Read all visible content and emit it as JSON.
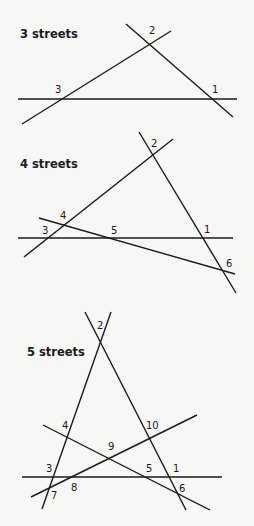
{
  "panels": [
    {
      "title": "3 streets",
      "title_pos": [
        20,
        38
      ],
      "lines": [
        [
          18,
          99,
          237,
          99
        ],
        [
          22,
          124,
          171,
          31
        ],
        [
          126,
          24,
          233,
          117
        ]
      ],
      "labels": [
        {
          "text": "2",
          "x": 149,
          "y": 34
        },
        {
          "text": "3",
          "x": 55,
          "y": 93
        },
        {
          "text": "1",
          "x": 212,
          "y": 93
        }
      ]
    },
    {
      "title": "4 streets",
      "title_pos": [
        20,
        168
      ],
      "lines": [
        [
          18,
          238,
          233,
          238
        ],
        [
          24,
          257,
          173,
          139
        ],
        [
          139,
          132,
          236,
          293
        ],
        [
          39,
          218,
          235,
          274
        ]
      ],
      "labels": [
        {
          "text": "2",
          "x": 151,
          "y": 147
        },
        {
          "text": "4",
          "x": 60,
          "y": 219
        },
        {
          "text": "3",
          "x": 42,
          "y": 234
        },
        {
          "text": "5",
          "x": 111,
          "y": 234
        },
        {
          "text": "1",
          "x": 204,
          "y": 233
        },
        {
          "text": "6",
          "x": 226,
          "y": 267
        }
      ]
    },
    {
      "title": "5 streets",
      "title_pos": [
        27,
        356
      ],
      "lines": [
        [
          22,
          477,
          222,
          477
        ],
        [
          42,
          509,
          111,
          312
        ],
        [
          85,
          312,
          186,
          510
        ],
        [
          43,
          425,
          210,
          510
        ],
        [
          31,
          497,
          197,
          415
        ]
      ],
      "labels": [
        {
          "text": "2",
          "x": 97,
          "y": 329
        },
        {
          "text": "4",
          "x": 62,
          "y": 429
        },
        {
          "text": "10",
          "x": 146,
          "y": 429
        },
        {
          "text": "9",
          "x": 108,
          "y": 450
        },
        {
          "text": "3",
          "x": 46,
          "y": 472
        },
        {
          "text": "8",
          "x": 71,
          "y": 491
        },
        {
          "text": "5",
          "x": 146,
          "y": 472
        },
        {
          "text": "1",
          "x": 173,
          "y": 472
        },
        {
          "text": "7",
          "x": 51,
          "y": 499
        },
        {
          "text": "6",
          "x": 179,
          "y": 492
        }
      ]
    }
  ]
}
